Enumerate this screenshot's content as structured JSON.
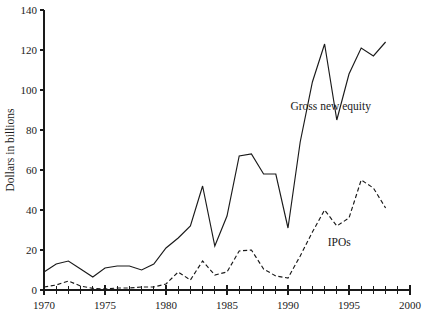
{
  "chart_data": {
    "type": "line",
    "title": "",
    "subtitle": "",
    "xlabel": "",
    "ylabel": "Dollars in billions",
    "xlim": [
      1970,
      2000
    ],
    "ylim": [
      0,
      140
    ],
    "grid": false,
    "legend_position": "inline-annotation",
    "y_ticks": [
      0,
      20,
      40,
      60,
      80,
      100,
      120,
      140
    ],
    "y_tick_labels": [
      "0",
      "20",
      "40",
      "60",
      "80",
      "100",
      "120",
      "140"
    ],
    "x_ticks": [
      1970,
      1975,
      1980,
      1985,
      1990,
      1995,
      2000
    ],
    "x_tick_labels": [
      "1970",
      "1975",
      "1980",
      "1985",
      "1990",
      "1995",
      "2000"
    ],
    "x_minor_tick_step": 1,
    "x": [
      1970,
      1971,
      1972,
      1973,
      1974,
      1975,
      1976,
      1977,
      1978,
      1979,
      1980,
      1981,
      1982,
      1983,
      1984,
      1985,
      1986,
      1987,
      1988,
      1989,
      1990,
      1991,
      1992,
      1993,
      1994,
      1995,
      1996,
      1997,
      1998
    ],
    "series": [
      {
        "name": "Gross new equity",
        "style": "solid",
        "color": "#1a1a1a",
        "values": [
          9,
          13,
          14.5,
          10.5,
          6.5,
          11,
          12,
          12,
          10,
          13,
          21,
          26,
          32,
          52,
          22,
          37,
          67,
          68,
          58,
          58,
          31,
          74,
          104,
          123,
          85,
          108,
          121,
          117,
          124
        ]
      },
      {
        "name": "IPOs",
        "style": "dashed",
        "color": "#1a1a1a",
        "values": [
          1.5,
          2.5,
          4.5,
          2,
          0.8,
          0.5,
          1,
          1,
          1.5,
          1.5,
          3,
          9,
          5,
          14.5,
          7.5,
          9,
          19.5,
          20,
          10.5,
          7,
          6,
          17,
          29,
          40,
          32,
          36,
          55,
          51,
          41
        ]
      }
    ],
    "annotations": [
      {
        "text": "Gross new equity",
        "x": 1993.5,
        "y": 90
      },
      {
        "text": "IPOs",
        "x": 1994.2,
        "y": 22
      }
    ]
  }
}
